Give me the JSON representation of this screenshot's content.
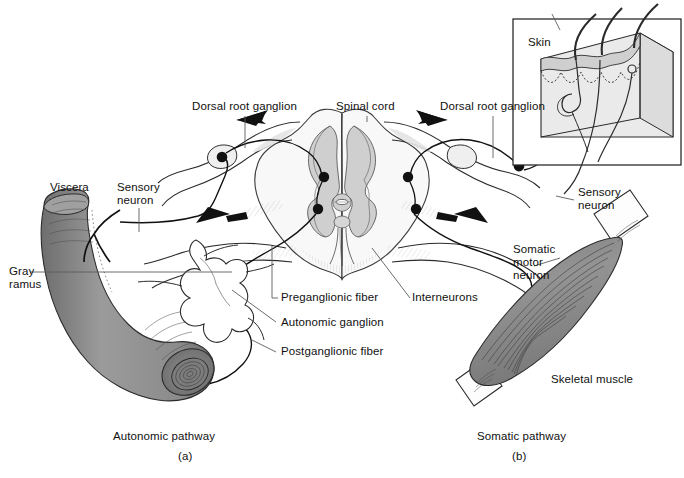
{
  "figure": {
    "title_a": "Autonomic pathway",
    "title_b": "Somatic pathway",
    "panel_a_id": "(a)",
    "panel_b_id": "(b)",
    "colors": {
      "line": "#1a1a1a",
      "organ_fill": "#8f8f8f",
      "muscle_fill": "#8a8a8a",
      "gray_matter": "#cfcfcf",
      "white_matter": "#f7f7f7",
      "skin_fill": "#d8d8d8",
      "background": "#ffffff"
    }
  },
  "labels": {
    "dorsal_root_ganglion_left": "Dorsal root ganglion",
    "spinal_cord": "Spinal cord",
    "dorsal_root_ganglion_right": "Dorsal root ganglion",
    "skin": "Skin",
    "viscera": "Viscera",
    "sensory_neuron_left": "Sensory\nneuron",
    "sensory_neuron_right": "Sensory\nneuron",
    "gray_ramus": "Gray\nramus",
    "preganglionic_fiber": "Preganglionic fiber",
    "autonomic_ganglion": "Autonomic ganglion",
    "postganglionic_fiber": "Postganglionic fiber",
    "interneurons": "Interneurons",
    "somatic_motor_neuron": "Somatic\nmotor\nneuron",
    "skeletal_muscle": "Skeletal muscle"
  },
  "structures": {
    "spinal_cord_section": "spinal-cord-cross-section",
    "gray_matter": "butterfly-gray-matter",
    "left_ganglion_cell": "dorsal-root-ganglion-cell-body-left",
    "right_ganglion_cell": "dorsal-root-ganglion-cell-body-right",
    "synapse_count_left": 2,
    "synapse_count_right": 2,
    "arrow_count": 4,
    "hair_count": 3,
    "viscera_organ": "smooth-muscle-tube",
    "autonomic_ganglion_node": "star-shaped-ganglion",
    "skeletal_muscle_organ": "fusiform-skeletal-muscle",
    "skin_block": "skin-block-diagram"
  }
}
